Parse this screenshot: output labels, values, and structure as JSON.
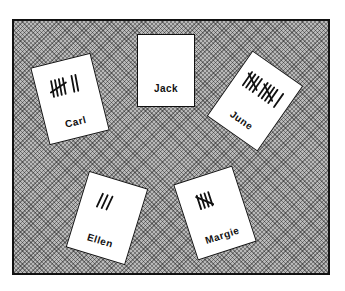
{
  "scene": {
    "description": "Tally cards on a board",
    "cards": [
      {
        "name": "Carl",
        "tally": 7
      },
      {
        "name": "Jack",
        "tally": 0
      },
      {
        "name": "June",
        "tally": 11
      },
      {
        "name": "Ellen",
        "tally": 3
      },
      {
        "name": "Margie",
        "tally": 5
      }
    ]
  }
}
